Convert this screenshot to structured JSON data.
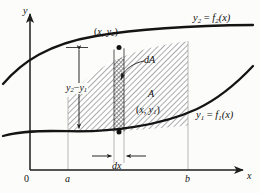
{
  "figure": {
    "background_color": "#fcfcfa",
    "ink_color": "#111111",
    "hatch_color": "#5a5a5a",
    "axis_color": "#2b2b2b",
    "guide_color": "#9a9a9a"
  },
  "axes": {
    "y_axis_label": "y",
    "x_axis_label": "x",
    "origin_label": "0",
    "x_ticks": [
      {
        "id": "a",
        "label": "a",
        "x_px": 68
      },
      {
        "id": "b",
        "label": "b",
        "x_px": 188
      }
    ]
  },
  "curves": [
    {
      "id": "upper",
      "label_y": "y",
      "label_y_sub": "2",
      "label_eq": "=",
      "label_f": "f",
      "label_f_sub": "2",
      "label_arg": "(x)",
      "label_full": "y₂ = f₂(x)"
    },
    {
      "id": "lower",
      "label_y": "y",
      "label_y_sub": "1",
      "label_eq": "=",
      "label_f": "f",
      "label_f_sub": "1",
      "label_arg": "(x)",
      "label_full": "y₁ = f₁(x)"
    }
  ],
  "annotations": {
    "point_upper": {
      "open": "(",
      "x": "x",
      "comma": ", ",
      "y": "y",
      "y_sub": "2",
      "close": ")",
      "text": "(x, y₂)"
    },
    "point_lower": {
      "open": "(",
      "x": "x",
      "comma": ", ",
      "y": "y",
      "y_sub": "1",
      "close": ")",
      "text": "(x, y₁)"
    },
    "height": {
      "y2": "y",
      "y2_sub": "2",
      "minus": "−",
      "y1": "y",
      "y1_sub": "1",
      "text": "y₂ − y₁"
    },
    "dA": "dA",
    "A": "A",
    "dx": "dx"
  },
  "region": {
    "shaded_from": "a",
    "shaded_to": "b",
    "strip_label": "dA",
    "area_label": "A"
  }
}
